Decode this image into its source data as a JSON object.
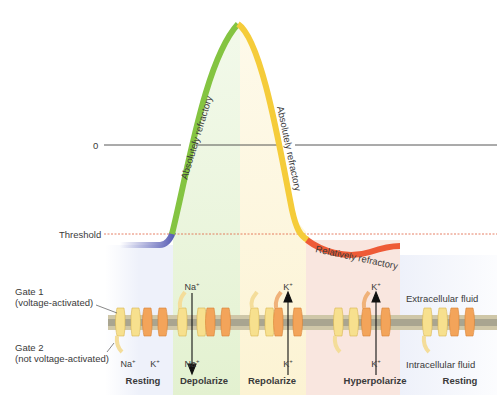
{
  "axis": {
    "zero_label": "0",
    "threshold_label": "Threshold"
  },
  "curve_labels": {
    "rising": "Absolutely refractory",
    "falling": "Absolutely refractory",
    "undershoot": "Relatively refractory"
  },
  "gates": {
    "gate1": [
      "Gate 1",
      "(voltage-activated)"
    ],
    "gate2": [
      "Gate 2",
      "(not voltage-activated)"
    ]
  },
  "fluids": {
    "extracellular": "Extracellular fluid",
    "intracellular": "Intracellular fluid"
  },
  "phases": [
    {
      "label": "Resting",
      "x": 143
    },
    {
      "label": "Depolarize",
      "x": 204
    },
    {
      "label": "Repolarize",
      "x": 272
    },
    {
      "label": "Hyperpolarize",
      "x": 375
    },
    {
      "label": "Resting",
      "x": 460
    }
  ],
  "ions": [
    {
      "text": "Na",
      "x": 128,
      "y": 384
    },
    {
      "text": "K",
      "x": 155,
      "y": 384
    },
    {
      "text": "Na",
      "x": 192,
      "y": 282
    },
    {
      "text": "Na",
      "x": 192,
      "y": 384
    },
    {
      "text": "K",
      "x": 288,
      "y": 282
    },
    {
      "text": "K",
      "x": 288,
      "y": 384
    },
    {
      "text": "K",
      "x": 376,
      "y": 282
    },
    {
      "text": "K",
      "x": 376,
      "y": 384
    }
  ],
  "colors": {
    "resting": "#6a6fc0",
    "depolarize": "#84c441",
    "repolarize": "#f5cc3a",
    "hyperpolarize": "#ee5a36",
    "band_resting": "#eef1fa",
    "band_depolarize": "#eaf5dc",
    "band_repolarize": "#fdf6dc",
    "band_hyperpolarize": "#f9e6df"
  }
}
